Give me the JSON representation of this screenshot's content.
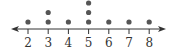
{
  "chart_data": {
    "type": "scatter",
    "subtype": "dot_plot",
    "title": "",
    "xlabel": "",
    "ylabel": "",
    "x_ticks": [
      2,
      3,
      4,
      5,
      6,
      7,
      8
    ],
    "xlim": [
      2,
      8
    ],
    "grid": false,
    "legend": null,
    "categories": [
      2,
      3,
      4,
      5,
      6,
      7,
      8
    ],
    "values": [
      1,
      2,
      1,
      3,
      1,
      1,
      1
    ],
    "axis_arrows": "both",
    "dot_color": "#555555",
    "axis_color": "#333333"
  }
}
